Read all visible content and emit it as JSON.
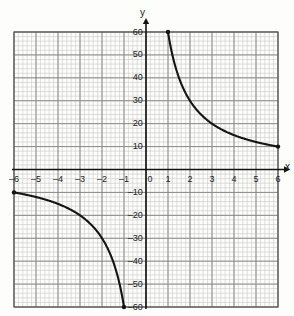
{
  "chart_data": {
    "type": "line",
    "title": "",
    "xlabel": "x",
    "ylabel": "y",
    "grid": true,
    "legend": "none",
    "xlim": [
      -6,
      6
    ],
    "ylim": [
      -60,
      60
    ],
    "xticks": [
      -6,
      -5,
      -4,
      -3,
      -2,
      -1,
      0,
      1,
      2,
      3,
      4,
      5,
      6
    ],
    "xticklabels": [
      "–6",
      "–5",
      "–4",
      "–3",
      "–2",
      "–1",
      "0",
      "1",
      "2",
      "3",
      "4",
      "5",
      "6"
    ],
    "yticks": [
      60,
      50,
      40,
      30,
      20,
      10,
      -10,
      -20,
      -30,
      -40,
      -50,
      -60
    ],
    "yticklabels": [
      "60",
      "50",
      "40",
      "30",
      "20",
      "10",
      "–10",
      "–20",
      "–30",
      "–40",
      "–50",
      "–60"
    ],
    "minor_grid_step_x": 0.2,
    "minor_grid_step_y": 2,
    "major_grid_step_x": 1,
    "major_grid_step_y": 10,
    "series": [
      {
        "name": "y = 60/x (branch 1)",
        "x": [
          1,
          1.2,
          1.4,
          1.6,
          1.8,
          2,
          2.4,
          2.8,
          3.2,
          3.6,
          4,
          4.5,
          5,
          5.5,
          6
        ],
        "y": [
          60,
          50,
          42.9,
          37.5,
          33.3,
          30,
          25,
          21.4,
          18.8,
          16.7,
          15,
          13.3,
          12,
          10.9,
          10
        ],
        "endpoints": [
          [
            1,
            60
          ],
          [
            6,
            10
          ]
        ]
      },
      {
        "name": "y = 60/x (branch 2)",
        "x": [
          -6,
          -5.5,
          -5,
          -4.5,
          -4,
          -3.6,
          -3.2,
          -2.8,
          -2.4,
          -2,
          -1.8,
          -1.6,
          -1.4,
          -1.2,
          -1
        ],
        "y": [
          -10,
          -10.9,
          -12,
          -13.3,
          -15,
          -16.7,
          -18.8,
          -21.4,
          -25,
          -30,
          -33.3,
          -37.5,
          -42.9,
          -50,
          -60
        ],
        "endpoints": [
          [
            -6,
            -10
          ],
          [
            -1,
            -60
          ]
        ]
      }
    ],
    "colors": {
      "curve": "#141414",
      "axis": "#141414",
      "major_grid": "#8a8a8a",
      "minor_grid": "#c9c9c9",
      "background": "#fdfdfb",
      "text": "#1a1a1a"
    }
  },
  "axis_labels": {
    "x_axis_name": "x",
    "y_axis_name": "y"
  }
}
